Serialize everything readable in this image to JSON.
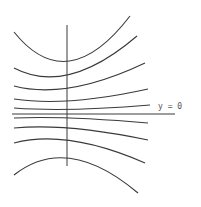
{
  "diagram": {
    "title": "",
    "label_y0": "y = 0",
    "axis": {
      "vertical": {
        "x": 67,
        "y1": 25,
        "y2": 166
      },
      "horizontal": {
        "y": 114,
        "x1": 12,
        "x2": 175
      }
    },
    "curves": [
      {
        "name": "curve-1",
        "d": "M14,32 Q67,98 130,16"
      },
      {
        "name": "curve-2",
        "d": "M14,68 Q67,96 137,36"
      },
      {
        "name": "curve-3",
        "d": "M14,86 Q67,100 145,63"
      },
      {
        "name": "curve-4",
        "d": "M14,99 Q67,107 148,89"
      },
      {
        "name": "curve-5",
        "d": "M14,108 Q67,112 150,105"
      },
      {
        "name": "curve-6",
        "d": "M14,118 Q67,116 148,123"
      },
      {
        "name": "curve-7",
        "d": "M14,128 Q67,123 148,140"
      },
      {
        "name": "curve-8",
        "d": "M14,143 Q67,129 145,163"
      },
      {
        "name": "curve-9",
        "d": "M14,175 Q67,133 138,193"
      }
    ],
    "colors": {
      "stroke": "#3a3a3a",
      "label": "#555555",
      "background": "#ffffff"
    }
  }
}
